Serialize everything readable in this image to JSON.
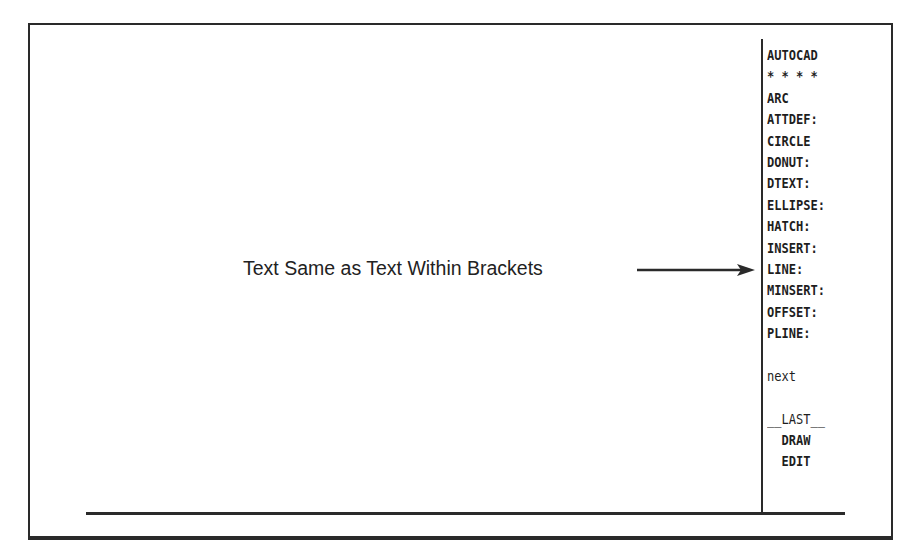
{
  "annotation": {
    "label": "Text Same as Text Within Brackets"
  },
  "screen_menu": {
    "items": [
      {
        "label": "AUTOCAD"
      },
      {
        "label": "* * * *"
      },
      {
        "label": "ARC"
      },
      {
        "label": "ATTDEF:"
      },
      {
        "label": "CIRCLE"
      },
      {
        "label": "DONUT:"
      },
      {
        "label": "DTEXT:"
      },
      {
        "label": "ELLIPSE:"
      },
      {
        "label": "HATCH:"
      },
      {
        "label": "INSERT:"
      },
      {
        "label": "LINE:"
      },
      {
        "label": "MINSERT:"
      },
      {
        "label": "OFFSET:"
      },
      {
        "label": "PLINE:"
      },
      {
        "label": ""
      },
      {
        "label": "next"
      },
      {
        "label": ""
      },
      {
        "label": "__LAST__"
      },
      {
        "label": "  DRAW"
      },
      {
        "label": "  EDIT"
      }
    ]
  },
  "colors": {
    "line": "#2a2a2a",
    "text": "#1e1e1e",
    "background": "#ffffff"
  }
}
